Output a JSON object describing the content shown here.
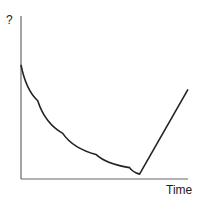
{
  "chart_data": {
    "type": "line",
    "title": "",
    "xlabel": "Time",
    "ylabel": "?",
    "grid": false,
    "legend": null,
    "axis_ticks": false,
    "series": [
      {
        "name": "curve",
        "description": "Starts high, decays convexly (exponential-like) to a minimum, then rises linearly",
        "points_normalized": [
          {
            "x": 0.0,
            "y": 0.7
          },
          {
            "x": 0.1,
            "y": 0.48
          },
          {
            "x": 0.25,
            "y": 0.28
          },
          {
            "x": 0.45,
            "y": 0.15
          },
          {
            "x": 0.65,
            "y": 0.07
          },
          {
            "x": 0.71,
            "y": 0.03
          },
          {
            "x": 1.0,
            "y": 0.55
          }
        ]
      }
    ],
    "colors": {
      "axis": "#555555",
      "line": "#222222"
    }
  },
  "labels": {
    "y_axis": "?",
    "x_axis": "Time"
  }
}
